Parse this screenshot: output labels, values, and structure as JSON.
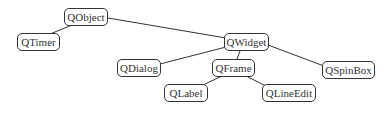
{
  "diagram": {
    "type": "class-hierarchy",
    "nodes": [
      {
        "id": "QObject",
        "label": "QObject",
        "x": 64,
        "y": 8,
        "w": 44,
        "h": 18
      },
      {
        "id": "QTimer",
        "label": "QTimer",
        "x": 17,
        "y": 33,
        "w": 43,
        "h": 18
      },
      {
        "id": "QWidget",
        "label": "QWidget",
        "x": 224,
        "y": 33,
        "w": 45,
        "h": 18
      },
      {
        "id": "QDialog",
        "label": "QDialog",
        "x": 117,
        "y": 59,
        "w": 44,
        "h": 18
      },
      {
        "id": "QFrame",
        "label": "QFrame",
        "x": 212,
        "y": 59,
        "w": 43,
        "h": 18
      },
      {
        "id": "QSpinBox",
        "label": "QSpinBox",
        "x": 322,
        "y": 61,
        "w": 53,
        "h": 18
      },
      {
        "id": "QLabel",
        "label": "QLabel",
        "x": 164,
        "y": 84,
        "w": 44,
        "h": 18
      },
      {
        "id": "QLineEdit",
        "label": "QLineEdit",
        "x": 262,
        "y": 84,
        "w": 54,
        "h": 18
      }
    ],
    "edges": [
      {
        "from": "QObject",
        "to": "QTimer"
      },
      {
        "from": "QObject",
        "to": "QWidget"
      },
      {
        "from": "QWidget",
        "to": "QDialog"
      },
      {
        "from": "QWidget",
        "to": "QFrame"
      },
      {
        "from": "QWidget",
        "to": "QSpinBox"
      },
      {
        "from": "QFrame",
        "to": "QLabel"
      },
      {
        "from": "QFrame",
        "to": "QLineEdit"
      }
    ],
    "colors": {
      "stroke": "#333333",
      "background": "#ffffff",
      "text": "#333333"
    }
  }
}
